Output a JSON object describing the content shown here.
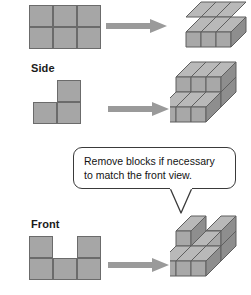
{
  "figure": {
    "background_color": "#ffffff",
    "palette": {
      "cube_top": "#b9b9b9",
      "cube_front": "#a8a8a8",
      "cube_side": "#8e8e8e",
      "cube_edge": "#5f5f5f",
      "grid_fill": "#a6a6a6",
      "grid_edge": "#6b6b6b",
      "arrow": "#9a9a9a",
      "callout_border": "#3a3a3a",
      "text": "#131313"
    }
  },
  "steps": [
    {
      "id": "step-top",
      "label": "",
      "flat_view": {
        "name": "top-view-grid",
        "columns": 3,
        "rows": 2,
        "filled": [
          [
            1,
            1,
            1
          ],
          [
            1,
            1,
            1
          ]
        ]
      },
      "arrow": {
        "name": "arrow-right",
        "direction": "right"
      },
      "solid": {
        "name": "block-structure-layer-1",
        "description": "3 by 2 single layer of cubes",
        "levels": 1
      }
    },
    {
      "id": "step-side",
      "label": "Side",
      "flat_view": {
        "name": "side-view-grid",
        "columns": 2,
        "rows": 2,
        "filled": [
          [
            0,
            1
          ],
          [
            1,
            1
          ]
        ]
      },
      "arrow": {
        "name": "arrow-right",
        "direction": "right"
      },
      "solid": {
        "name": "block-structure-stepped",
        "description": "3 by 2 base layer with a 3 by 1 upper layer at the back",
        "levels": 2
      }
    },
    {
      "id": "step-front",
      "label": "Front",
      "flat_view": {
        "name": "front-view-grid",
        "columns": 3,
        "rows": 2,
        "filled": [
          [
            1,
            0,
            1
          ],
          [
            1,
            1,
            1
          ]
        ]
      },
      "arrow": {
        "name": "arrow-right",
        "direction": "right"
      },
      "solid": {
        "name": "block-structure-final",
        "description": "3 by 2 base layer with upper cubes on the left and right columns only",
        "levels": 2
      }
    }
  ],
  "callout": {
    "name": "instruction-callout",
    "text": "Remove blocks if necessary\nto match the front view."
  }
}
